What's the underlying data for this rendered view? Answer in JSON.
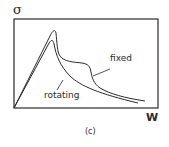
{
  "figure": {
    "panel_label": "(c)",
    "y_axis_label": "σ",
    "x_axis_label": "W"
  },
  "curves": [
    {
      "name": "fixed",
      "label": "fixed"
    },
    {
      "name": "rotating",
      "label": "rotating"
    }
  ],
  "colors": {
    "line": "#2a2a2a",
    "background": "#ffffff"
  }
}
